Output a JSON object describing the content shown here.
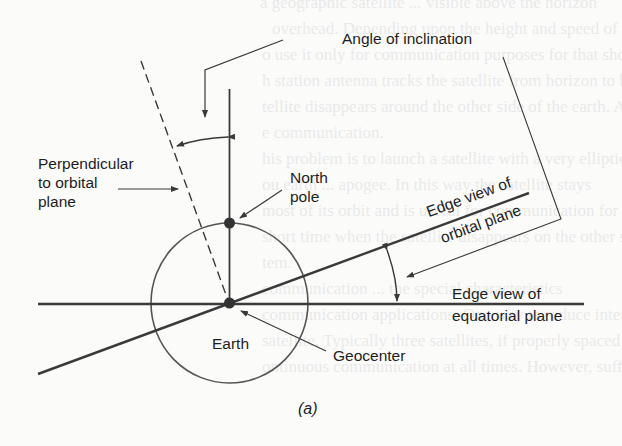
{
  "figure": {
    "caption": "(a)",
    "labels": {
      "angle_of_inclination": "Angle of inclination",
      "perpendicular_line1": "Perpendicular",
      "perpendicular_line2": "to orbital",
      "perpendicular_line3": "plane",
      "north_pole_line1": "North",
      "north_pole_line2": "pole",
      "orbital_plane_line1": "Edge view of",
      "orbital_plane_line2": "orbital plane",
      "equatorial_plane_line1": "Edge view of",
      "equatorial_plane_line2": "equatorial plane",
      "earth": "Earth",
      "geocenter": "Geocenter"
    },
    "colors": {
      "ink": "#3a3a3a",
      "text": "#1e1e1e",
      "paper": "#fbfbfa"
    }
  },
  "background_bleed_text": [
    "a geographic satellite ... visible above the horizon",
    "overhead. Depending upon the height and speed of the sa",
    "o use it only for communication purposes for that short pe",
    "h station antenna tracks the satellite from horizon to ho",
    "tellite disappears around the other side of the earth. At th",
    "e communication.",
    "his problem is to launch a satellite with a very elliptic",
    "ou earth ... apogee. In this way the satellite stays",
    "most of its orbit and is useful for communication for a lo",
    "short time when the satellite disappears on the other s",
    "tem.",
    "communication ... the special characteristics",
    "communication applications. One way to reduce interrup",
    "satellite. Typically three satellites, if properly spaced in t",
    "ontinuous communication at all times. However, sufficien"
  ]
}
